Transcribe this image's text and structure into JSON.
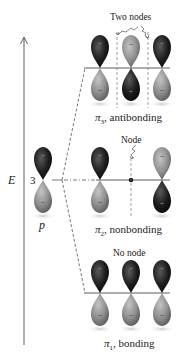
{
  "diagram": {
    "axis": {
      "label": "E"
    },
    "atomic_orbital": {
      "count": "3",
      "label": "p"
    },
    "levels": [
      {
        "id": "pi3",
        "symbol": "π",
        "subscript": "3",
        "label_rest": ", antibonding",
        "node_label": "Two nodes",
        "phases": [
          "top-dark",
          "top-light",
          "top-dark"
        ]
      },
      {
        "id": "pi2",
        "symbol": "π",
        "subscript": "2",
        "label_rest": ", nonbonding",
        "node_label": "Node",
        "phases": [
          "top-dark",
          "none",
          "top-light"
        ]
      },
      {
        "id": "pi1",
        "symbol": "π",
        "subscript": "1",
        "label_rest": ", bonding",
        "node_label": "No node",
        "phases": [
          "top-dark",
          "top-dark",
          "top-dark"
        ]
      }
    ],
    "colors": {
      "dark_lobe": "#1a1a1a",
      "light_lobe": "#8c8c8c",
      "line": "#333333",
      "dash": "#555555"
    }
  }
}
